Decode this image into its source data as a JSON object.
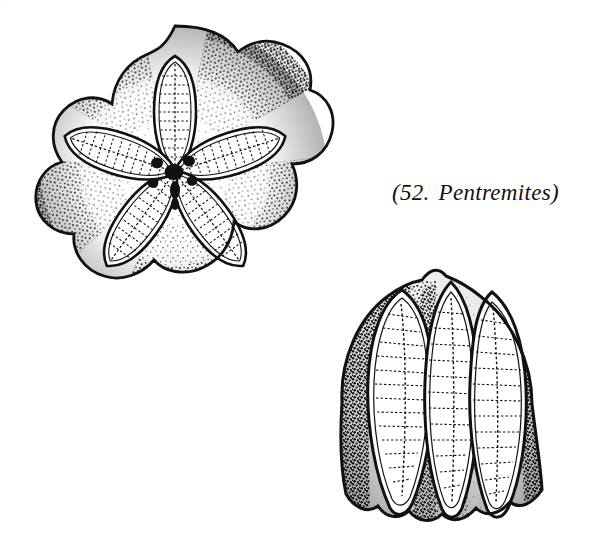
{
  "page": {
    "width": 602,
    "height": 553,
    "background_color": "#ffffff",
    "ink_color": "#111111",
    "style": "stipple line engraving"
  },
  "scan_artifact": {
    "description": "clipped bottom edge of a text line cropped off above the figure",
    "text": "(51.) Pentremites"
  },
  "figure_label": {
    "full_text": "(52.  Pentremites)",
    "number": "(52.",
    "genus": "Pentremites)",
    "style": "italic serif"
  },
  "figures": [
    {
      "id": "specimen-oral",
      "name": "oral-view",
      "caption_role": "top-down / oral view of calyx",
      "symmetry": "pentaradial",
      "ambulacra_count": 5,
      "features": [
        "mouth",
        "spiracles",
        "ambulacra",
        "deltoid plates",
        "radial plates",
        "side plates"
      ],
      "spiracle_count": 5
    },
    {
      "id": "specimen-lateral",
      "name": "lateral-view",
      "caption_role": "side view of calyx",
      "symmetry": "pentaradial",
      "ambulacra_count": 5,
      "visible_ambulacra": 3,
      "features": [
        "elongate ambulacra",
        "radial plates",
        "basal plates",
        "summit notch"
      ]
    }
  ]
}
